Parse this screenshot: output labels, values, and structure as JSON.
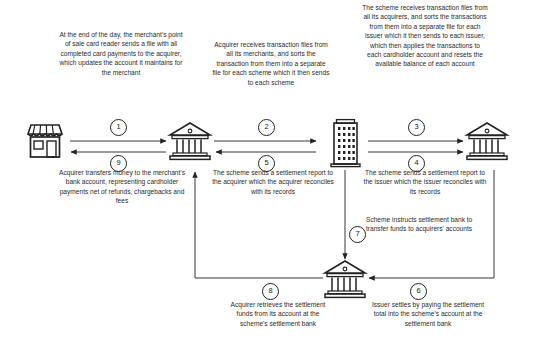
{
  "diagram": {
    "nodes": [
      {
        "id": "merchant",
        "icon_name": "storefront-icon",
        "label": "Merchant point of sale"
      },
      {
        "id": "acquirer",
        "icon_name": "bank-building-icon",
        "label": "Acquirer bank"
      },
      {
        "id": "scheme",
        "icon_name": "office-tower-icon",
        "label": "Scheme"
      },
      {
        "id": "issuer",
        "icon_name": "bank-building-icon",
        "label": "Issuer bank"
      },
      {
        "id": "settlement_bank",
        "icon_name": "bank-building-icon",
        "label": "Settlement bank"
      }
    ],
    "steps": [
      {
        "number": "1",
        "from": "merchant",
        "to": "acquirer",
        "direction": "right",
        "text": "At the end of the day, the merchant's point of sale card reader sends a file with all completed card payments to the acquirer, which updates the account it maintains for the merchant"
      },
      {
        "number": "2",
        "from": "acquirer",
        "to": "scheme",
        "direction": "right",
        "text": "Acquirer receives transaction files from all its merchants, and sorts the transaction from them into a separate file for each scheme which it then sends to each scheme"
      },
      {
        "number": "3",
        "from": "scheme",
        "to": "issuer",
        "direction": "right",
        "text": "The scheme receives transaction files from all its acquirers, and sorts the transactions from them into a separate file for each issuer which it then sends to each issuer, which then applies the transactions to each cardholder account and resets the available balance of each account"
      },
      {
        "number": "4",
        "from": "scheme",
        "to": "issuer",
        "direction": "right",
        "text": "The scheme sends a settlement report to the issuer which the issuer reconciles with its records"
      },
      {
        "number": "5",
        "from": "scheme",
        "to": "acquirer",
        "direction": "left",
        "text": "The scheme sends a settlement report to the acquirer which the acquirer reconciles with its records"
      },
      {
        "number": "6",
        "from": "issuer",
        "to": "settlement_bank",
        "direction": "left",
        "text": "Issuer settles by paying the settlement total into the scheme's account at the settlement bank"
      },
      {
        "number": "7",
        "from": "scheme",
        "to": "settlement_bank",
        "direction": "down",
        "text": "Scheme instructs settlement bank to transfer funds to acquirers' accounts"
      },
      {
        "number": "8",
        "from": "settlement_bank",
        "to": "acquirer",
        "direction": "left-up",
        "text": "Acquirer retrieves the settlement funds from its account at the scheme's settlement bank"
      },
      {
        "number": "9",
        "from": "acquirer",
        "to": "merchant",
        "direction": "left",
        "text": "Acquirer transfers money to the merchant's bank account, representing cardholder payments net of refunds, chargebacks and fees"
      }
    ],
    "colors": {
      "line": "#222222",
      "text": "#2b2b2b",
      "background": "#ffffff"
    }
  }
}
